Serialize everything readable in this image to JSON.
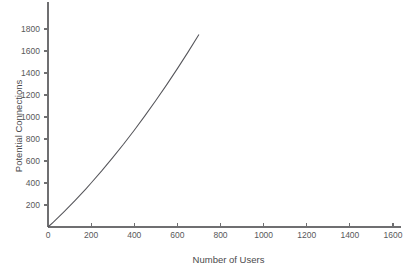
{
  "chart_data": {
    "type": "line",
    "title": "",
    "xlabel": "Number of Users",
    "ylabel": "Potential Connections",
    "xlim": [
      0,
      1600
    ],
    "ylim": [
      0,
      1960
    ],
    "grid": false,
    "legend": null,
    "x_ticks": [
      0,
      200,
      400,
      600,
      800,
      1000,
      1200,
      1400,
      1600
    ],
    "x_tick_labels": [
      "0",
      "200",
      "400",
      "600",
      "800",
      "1000",
      "1200",
      "1400",
      "1600"
    ],
    "y_ticks": [
      200,
      400,
      600,
      800,
      1000,
      1200,
      1400,
      1600,
      1800
    ],
    "y_tick_labels": [
      "200",
      "400",
      "600",
      "800",
      "1000",
      "1200",
      "1400",
      "1600",
      "1800"
    ],
    "series": [
      {
        "name": "Potential Connections",
        "color": "#55555a",
        "x": [
          0,
          25,
          50,
          75,
          100,
          125,
          150,
          175,
          200,
          250,
          300,
          350,
          400,
          450,
          500,
          550,
          600,
          650,
          700
        ],
        "y": [
          0,
          45,
          92,
          140,
          190,
          240,
          292,
          345,
          400,
          512,
          630,
          752,
          880,
          1012,
          1150,
          1292,
          1440,
          1592,
          1750
        ]
      }
    ]
  },
  "axes": {
    "x_axis_name": "x-axis",
    "y_axis_name": "y-axis"
  },
  "colors": {
    "background": "#ffffff",
    "axis": "#6f6f71",
    "tick_text": "#58585a",
    "axis_title": "#4a4a4c",
    "series": "#55555a"
  }
}
